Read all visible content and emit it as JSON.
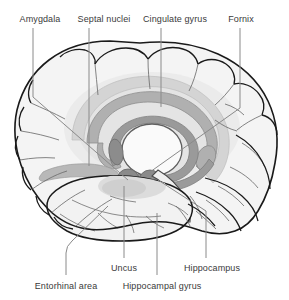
{
  "figure": {
    "type": "anatomical-diagram",
    "background_color": "#ffffff",
    "text_color": "#3a3a3a",
    "leader_line_color": "#8a8a8a",
    "outline_color": "#1a1a1a",
    "sulci_color": "#6e6e6e"
  },
  "palette": {
    "cortex_fill": "#f4f4f4",
    "cingulate_band": "#d9d9d9",
    "corpus_callosum": "#b6b6b6",
    "fornix": "#9a9a9a",
    "nuclei_dark": "#8c8c8c",
    "halo": "#e6e6e6",
    "thalamus_fill": "#fbfbfb"
  },
  "labels": {
    "top": [
      {
        "id": "amygdala",
        "text": "Amygdala",
        "x": 40,
        "y": 14,
        "anchor": "center"
      },
      {
        "id": "septal-nuclei",
        "text": "Septal nuclei",
        "x": 104,
        "y": 14,
        "anchor": "center"
      },
      {
        "id": "cingulate-gyrus",
        "text": "Cingulate gyrus",
        "x": 175,
        "y": 14,
        "anchor": "center"
      },
      {
        "id": "fornix",
        "text": "Fornix",
        "x": 241,
        "y": 14,
        "anchor": "center"
      }
    ],
    "bottom": [
      {
        "id": "uncus",
        "text": "Uncus",
        "x": 124,
        "y": 263,
        "anchor": "center"
      },
      {
        "id": "hippocampus",
        "text": "Hippocampus",
        "x": 212,
        "y": 263,
        "anchor": "center"
      },
      {
        "id": "entorhinal-area",
        "text": "Entorhinal area",
        "x": 66,
        "y": 281,
        "anchor": "center"
      },
      {
        "id": "hippocampal-gyrus",
        "text": "Hippocampal gyrus",
        "x": 162,
        "y": 281,
        "anchor": "center"
      }
    ]
  },
  "leaders": {
    "amygdala": "M33,28 L33,97 L128,180",
    "septal_nuclei": "M89,28 L89,166",
    "cingulate_gyrus": "M161,28 L161,107",
    "fornix": "M240,28 L240,108 L150,172",
    "uncus": "M124,258 L124,186",
    "hippocampus": "M206,258 L206,211 L158,180",
    "entorhinal_area": "M66,275 L66,253 Q66,246 72,241 L108,206",
    "hippocampal_gyrus": "M157,275 L157,213"
  },
  "structures": [
    {
      "id": "cerebral-cortex",
      "name": "Cerebral cortex outline"
    },
    {
      "id": "cingulate-band",
      "name": "Cingulate gyrus band"
    },
    {
      "id": "corpus-callosum",
      "name": "Corpus callosum"
    },
    {
      "id": "fornix-arc",
      "name": "Fornix arc"
    },
    {
      "id": "thalamus",
      "name": "Thalamus"
    },
    {
      "id": "septal-nucleus",
      "name": "Septal nuclei body"
    },
    {
      "id": "amygdala-body",
      "name": "Amygdala"
    },
    {
      "id": "uncus-body",
      "name": "Uncus"
    },
    {
      "id": "temporal-lobe",
      "name": "Temporal lobe"
    },
    {
      "id": "hippocampus-tail",
      "name": "Hippocampal formation"
    },
    {
      "id": "brainstem",
      "name": "Brainstem / midbrain"
    }
  ]
}
